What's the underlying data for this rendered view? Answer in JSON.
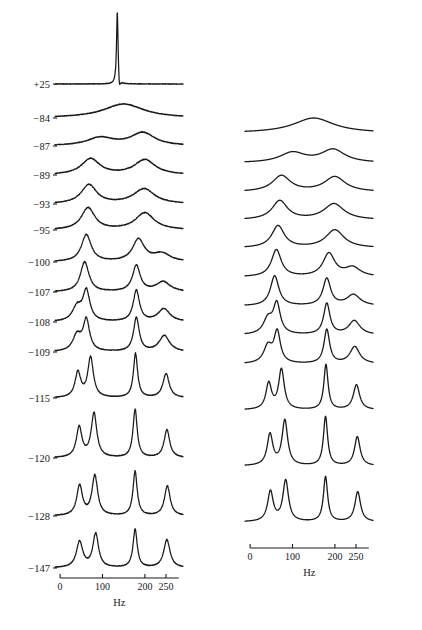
{
  "figure": {
    "units_label": "Hz",
    "line_color": "#1a1a1a",
    "background": "#ffffff"
  },
  "axes": {
    "x_ticks": [
      0,
      100,
      200,
      250
    ],
    "x_tick_labels": [
      "0",
      "100",
      "200",
      "250"
    ],
    "x_min": -12,
    "x_max": 290,
    "x_unit": "Hz"
  },
  "temperature_labels": [
    "+25",
    "−84",
    "−87",
    "−89",
    "−93",
    "−95",
    "−100",
    "−107",
    "−108",
    "−109",
    "−115",
    "−120",
    "−128",
    "−147"
  ],
  "chart_data": {
    "type": "line",
    "title": "",
    "subtitle": "",
    "xlabel": "Hz",
    "ylabel": "",
    "xlim": [
      -12,
      290
    ],
    "grid": false,
    "legend": "none",
    "x_ticks": [
      0,
      100,
      200,
      250
    ],
    "annotations": [
      "+25",
      "-84",
      "-87",
      "-89",
      "-93",
      "-95",
      "-100",
      "-107",
      "-108",
      "-109",
      "-115",
      "-120",
      "-128",
      "-147"
    ],
    "panels": [
      {
        "name": "experimental",
        "column": "left",
        "noisy": true,
        "traces": [
          {
            "label": "+25",
            "baseline_y": 84,
            "peaks": [
              {
                "center": 135,
                "height": 74,
                "width": 2.2
              }
            ],
            "undershoot": {
              "center": 140,
              "depth": 11,
              "width": 2.5
            }
          },
          {
            "label": "−84",
            "baseline_y": 118,
            "peaks": [
              {
                "center": 150,
                "height": 14,
                "width": 58
              }
            ]
          },
          {
            "label": "−87",
            "baseline_y": 146,
            "peaks": [
              {
                "center": 95,
                "height": 8,
                "width": 38
              },
              {
                "center": 195,
                "height": 13,
                "width": 34
              }
            ]
          },
          {
            "label": "−89",
            "baseline_y": 175,
            "peaks": [
              {
                "center": 72,
                "height": 16,
                "width": 26
              },
              {
                "center": 200,
                "height": 15,
                "width": 30
              }
            ]
          },
          {
            "label": "−93",
            "baseline_y": 204,
            "peaks": [
              {
                "center": 68,
                "height": 19,
                "width": 22
              },
              {
                "center": 198,
                "height": 15,
                "width": 30
              }
            ]
          },
          {
            "label": "−95",
            "baseline_y": 230,
            "peaks": [
              {
                "center": 66,
                "height": 22,
                "width": 19
              },
              {
                "center": 200,
                "height": 17,
                "width": 27
              }
            ]
          },
          {
            "label": "−100",
            "baseline_y": 262,
            "peaks": [
              {
                "center": 62,
                "height": 27,
                "width": 14
              },
              {
                "center": 185,
                "height": 22,
                "width": 17
              },
              {
                "center": 240,
                "height": 8,
                "width": 24
              }
            ]
          },
          {
            "label": "−107",
            "baseline_y": 292,
            "peaks": [
              {
                "center": 58,
                "height": 30,
                "width": 12
              },
              {
                "center": 180,
                "height": 26,
                "width": 11
              },
              {
                "center": 243,
                "height": 10,
                "width": 20
              }
            ]
          },
          {
            "label": "−108",
            "baseline_y": 322,
            "peaks": [
              {
                "center": 40,
                "height": 14,
                "width": 13
              },
              {
                "center": 62,
                "height": 30,
                "width": 10
              },
              {
                "center": 180,
                "height": 31,
                "width": 9
              },
              {
                "center": 245,
                "height": 13,
                "width": 17
              }
            ]
          },
          {
            "label": "−109",
            "baseline_y": 352,
            "peaks": [
              {
                "center": 40,
                "height": 16,
                "width": 12
              },
              {
                "center": 62,
                "height": 31,
                "width": 9
              },
              {
                "center": 180,
                "height": 34,
                "width": 8
              },
              {
                "center": 246,
                "height": 16,
                "width": 15
              }
            ]
          },
          {
            "label": "−115",
            "baseline_y": 398,
            "peaks": [
              {
                "center": 42,
                "height": 25,
                "width": 8
              },
              {
                "center": 72,
                "height": 40,
                "width": 8
              },
              {
                "center": 178,
                "height": 44,
                "width": 6
              },
              {
                "center": 250,
                "height": 24,
                "width": 9
              }
            ]
          },
          {
            "label": "−120",
            "baseline_y": 458,
            "peaks": [
              {
                "center": 45,
                "height": 30,
                "width": 8
              },
              {
                "center": 80,
                "height": 44,
                "width": 8
              },
              {
                "center": 177,
                "height": 48,
                "width": 6
              },
              {
                "center": 252,
                "height": 28,
                "width": 8
              }
            ]
          },
          {
            "label": "−128",
            "baseline_y": 516,
            "peaks": [
              {
                "center": 46,
                "height": 30,
                "width": 8
              },
              {
                "center": 82,
                "height": 40,
                "width": 8
              },
              {
                "center": 177,
                "height": 44,
                "width": 6
              },
              {
                "center": 253,
                "height": 30,
                "width": 8
              }
            ]
          },
          {
            "label": "−147",
            "baseline_y": 568,
            "peaks": [
              {
                "center": 46,
                "height": 26,
                "width": 9
              },
              {
                "center": 84,
                "height": 34,
                "width": 8
              },
              {
                "center": 177,
                "height": 38,
                "width": 6
              },
              {
                "center": 252,
                "height": 28,
                "width": 9
              }
            ]
          }
        ]
      },
      {
        "name": "simulated",
        "column": "right",
        "noisy": false,
        "traces": [
          {
            "label": "−84",
            "baseline_y": 133,
            "peaks": [
              {
                "center": 150,
                "height": 15,
                "width": 58
              }
            ]
          },
          {
            "label": "−87",
            "baseline_y": 163,
            "peaks": [
              {
                "center": 100,
                "height": 10,
                "width": 36
              },
              {
                "center": 196,
                "height": 13,
                "width": 34
              }
            ]
          },
          {
            "label": "−89",
            "baseline_y": 192,
            "peaks": [
              {
                "center": 74,
                "height": 16,
                "width": 26
              },
              {
                "center": 200,
                "height": 15,
                "width": 30
              }
            ]
          },
          {
            "label": "−93",
            "baseline_y": 220,
            "peaks": [
              {
                "center": 70,
                "height": 19,
                "width": 22
              },
              {
                "center": 198,
                "height": 16,
                "width": 29
              }
            ]
          },
          {
            "label": "−95",
            "baseline_y": 248,
            "peaks": [
              {
                "center": 66,
                "height": 22,
                "width": 18
              },
              {
                "center": 200,
                "height": 18,
                "width": 26
              }
            ]
          },
          {
            "label": "−100",
            "baseline_y": 277,
            "peaks": [
              {
                "center": 62,
                "height": 27,
                "width": 14
              },
              {
                "center": 186,
                "height": 23,
                "width": 17
              },
              {
                "center": 242,
                "height": 9,
                "width": 22
              }
            ]
          },
          {
            "label": "−107",
            "baseline_y": 306,
            "peaks": [
              {
                "center": 58,
                "height": 30,
                "width": 12
              },
              {
                "center": 181,
                "height": 27,
                "width": 11
              },
              {
                "center": 244,
                "height": 11,
                "width": 19
              }
            ]
          },
          {
            "label": "−108",
            "baseline_y": 335,
            "peaks": [
              {
                "center": 42,
                "height": 15,
                "width": 13
              },
              {
                "center": 63,
                "height": 30,
                "width": 10
              },
              {
                "center": 181,
                "height": 31,
                "width": 9
              },
              {
                "center": 246,
                "height": 14,
                "width": 16
              }
            ]
          },
          {
            "label": "−109",
            "baseline_y": 364,
            "peaks": [
              {
                "center": 42,
                "height": 17,
                "width": 12
              },
              {
                "center": 64,
                "height": 31,
                "width": 9
              },
              {
                "center": 181,
                "height": 34,
                "width": 8
              },
              {
                "center": 247,
                "height": 17,
                "width": 14
              }
            ]
          },
          {
            "label": "−115",
            "baseline_y": 410,
            "peaks": [
              {
                "center": 44,
                "height": 26,
                "width": 8
              },
              {
                "center": 74,
                "height": 40,
                "width": 8
              },
              {
                "center": 179,
                "height": 45,
                "width": 6
              },
              {
                "center": 251,
                "height": 25,
                "width": 9
              }
            ]
          },
          {
            "label": "−120",
            "baseline_y": 466,
            "peaks": [
              {
                "center": 47,
                "height": 31,
                "width": 8
              },
              {
                "center": 82,
                "height": 45,
                "width": 8
              },
              {
                "center": 178,
                "height": 49,
                "width": 6
              },
              {
                "center": 253,
                "height": 29,
                "width": 8
              }
            ]
          },
          {
            "label": "−128",
            "baseline_y": 522,
            "peaks": [
              {
                "center": 48,
                "height": 30,
                "width": 8
              },
              {
                "center": 84,
                "height": 41,
                "width": 8
              },
              {
                "center": 178,
                "height": 45,
                "width": 6
              },
              {
                "center": 254,
                "height": 30,
                "width": 8
              }
            ]
          }
        ]
      }
    ]
  }
}
